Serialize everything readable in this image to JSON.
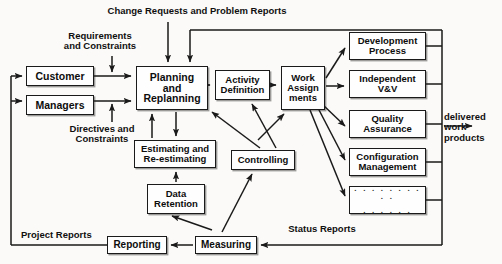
{
  "diagram": {
    "boxes": [
      {
        "id": "customer",
        "label": "Customer",
        "x": 26,
        "y": 66,
        "w": 68,
        "h": 20,
        "fs": 10.5
      },
      {
        "id": "managers",
        "label": "Managers",
        "x": 26,
        "y": 95,
        "w": 68,
        "h": 20,
        "fs": 10.5
      },
      {
        "id": "planning",
        "label": "Planning\nand\nReplanning",
        "x": 136,
        "y": 66,
        "w": 72,
        "h": 44,
        "fs": 10.5
      },
      {
        "id": "activity",
        "label": "Activity\nDefinition",
        "x": 215,
        "y": 70,
        "w": 55,
        "h": 30,
        "fs": 9.5
      },
      {
        "id": "workassign",
        "label": "Work\nAssign\nments",
        "x": 281,
        "y": 66,
        "w": 44,
        "h": 44,
        "fs": 9.5
      },
      {
        "id": "development",
        "label": "Development\nProcess",
        "x": 349,
        "y": 32,
        "w": 77,
        "h": 28,
        "fs": 9.5
      },
      {
        "id": "independent",
        "label": "Independent\nV&V",
        "x": 349,
        "y": 70,
        "w": 77,
        "h": 28,
        "fs": 9.5
      },
      {
        "id": "quality",
        "label": "Quality\nAssurance",
        "x": 349,
        "y": 110,
        "w": 77,
        "h": 28,
        "fs": 9.5
      },
      {
        "id": "configuration",
        "label": "Configuration\nManagement",
        "x": 349,
        "y": 148,
        "w": 77,
        "h": 28,
        "fs": 9.5
      },
      {
        "id": "estimating",
        "label": "Estimating and\nRe-estimating",
        "x": 134,
        "y": 140,
        "w": 82,
        "h": 28,
        "fs": 9.5
      },
      {
        "id": "controlling",
        "label": "Controlling",
        "x": 231,
        "y": 150,
        "w": 64,
        "h": 20,
        "fs": 9.5
      },
      {
        "id": "dataretention",
        "label": "Data\nRetention",
        "x": 147,
        "y": 184,
        "w": 58,
        "h": 30,
        "fs": 9.5
      },
      {
        "id": "reporting",
        "label": "Reporting",
        "x": 107,
        "y": 236,
        "w": 60,
        "h": 18,
        "fs": 10
      },
      {
        "id": "measuring",
        "label": "Measuring",
        "x": 195,
        "y": 236,
        "w": 62,
        "h": 18,
        "fs": 10
      }
    ],
    "ellipsis_box": {
      "id": "more-processes",
      "x": 349,
      "y": 186,
      "w": 77,
      "h": 28,
      "row1": ". . . . . . . . . .",
      "row2": ". . . . . ."
    },
    "labels": [
      {
        "id": "change-requests",
        "text": "Change Requests and Problem Reports",
        "x": 72,
        "y": 6,
        "w": 250,
        "fs": 9.5,
        "align": "center"
      },
      {
        "id": "requirements",
        "text": "Requirements\nand Constraints",
        "x": 50,
        "y": 31,
        "w": 100,
        "fs": 9.5,
        "align": "center"
      },
      {
        "id": "directives",
        "text": "Directives and\nConstraints",
        "x": 54,
        "y": 124,
        "w": 96,
        "fs": 9.5,
        "align": "center"
      },
      {
        "id": "delivered-work",
        "text": "delivered\nwork\nproducts",
        "x": 444,
        "y": 112,
        "w": 58,
        "fs": 9.5,
        "align": "left"
      },
      {
        "id": "status-reports",
        "text": "Status Reports",
        "x": 277,
        "y": 224,
        "w": 90,
        "fs": 9.5,
        "align": "center"
      },
      {
        "id": "project-reports",
        "text": "Project Reports",
        "x": 21,
        "y": 230,
        "w": 90,
        "fs": 9.5,
        "align": "left"
      }
    ],
    "colors": {
      "line": "#1a1a1a",
      "box_fill": "#fefefe",
      "text": "#0d0d0d",
      "background": "#fbfaf8"
    }
  }
}
